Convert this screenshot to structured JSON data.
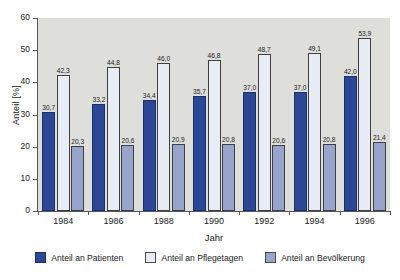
{
  "chart_data": {
    "type": "bar",
    "title": "",
    "subtitle": "",
    "xlabel": "Jahr",
    "ylabel": "Anteil [%]",
    "categories": [
      "1984",
      "1986",
      "1988",
      "1990",
      "1992",
      "1994",
      "1996"
    ],
    "ylim": [
      0,
      60
    ],
    "yticks": [
      "0",
      "10",
      "20",
      "30",
      "40",
      "50",
      "60"
    ],
    "grid": false,
    "legend_position": "bottom",
    "plot_background": "#dededa",
    "series": [
      {
        "name": "Anteil an Patienten",
        "color": "#2b4796",
        "values": [
          30.7,
          33.2,
          34.4,
          35.7,
          37.0,
          37.0,
          42.0
        ],
        "labels": [
          "30,7",
          "33,2",
          "34,4",
          "35,7",
          "37,0",
          "37,0",
          "42,0"
        ]
      },
      {
        "name": "Anteil an Pflegetagen",
        "color": "#e7ecf5",
        "values": [
          42.3,
          44.8,
          46.0,
          46.8,
          48.7,
          49.1,
          53.9
        ],
        "labels": [
          "42,3",
          "44,8",
          "46,0",
          "46,8",
          "48,7",
          "49,1",
          "53,9"
        ]
      },
      {
        "name": "Anteil an Bevölkerung",
        "color": "#97a5cd",
        "values": [
          20.3,
          20.6,
          20.9,
          20.8,
          20.6,
          20.8,
          21.4
        ],
        "labels": [
          "20,3",
          "20,6",
          "20,9",
          "20,8",
          "20,6",
          "20,8",
          "21,4"
        ]
      }
    ]
  }
}
